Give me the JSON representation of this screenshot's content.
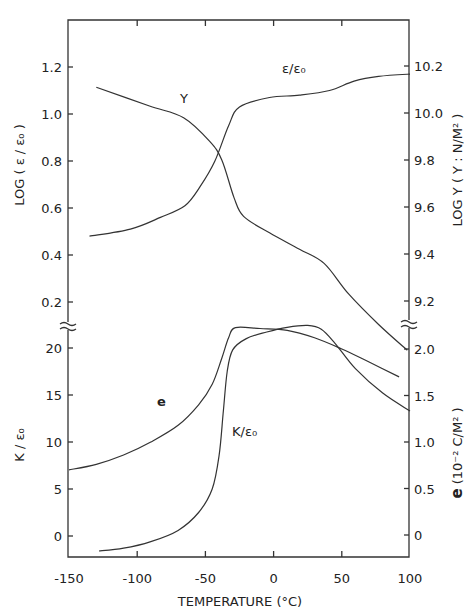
{
  "chart_data": [
    {
      "type": "line",
      "panel": "upper",
      "xlabel": "TEMPERATURE (°C)",
      "ylabel_left": "LOG (ε/ε₀)",
      "ylabel_right": "LOG Y (Y: N/M²)",
      "xlim": [
        -150,
        100
      ],
      "ylim_left": [
        0.1,
        1.4
      ],
      "ylim_right": [
        9.1,
        10.4
      ],
      "left_ticks": [
        "0.2",
        "0.4",
        "0.6",
        "0.8",
        "1.0",
        "1.2"
      ],
      "right_ticks": [
        "9.2",
        "9.4",
        "9.6",
        "9.8",
        "10.0",
        "10.2"
      ],
      "series": [
        {
          "name": "ε/ε₀",
          "axis": "left",
          "label": "ε/ε₀",
          "x": [
            -135,
            -105,
            -83,
            -65,
            -54,
            -43,
            -33,
            -25,
            -3,
            19,
            41,
            59,
            77,
            100
          ],
          "values": [
            0.48,
            0.51,
            0.56,
            0.61,
            0.69,
            0.8,
            0.95,
            1.03,
            1.07,
            1.08,
            1.1,
            1.14,
            1.16,
            1.17
          ]
        },
        {
          "name": "Y",
          "axis": "right",
          "label": "Y",
          "x": [
            -130,
            -91,
            -66,
            -47,
            -38,
            -29,
            -22,
            -3,
            19,
            37,
            55,
            77,
            98
          ],
          "values": [
            10.11,
            10.03,
            9.98,
            9.88,
            9.8,
            9.64,
            9.56,
            9.49,
            9.42,
            9.36,
            9.23,
            9.1,
            8.99
          ]
        }
      ]
    },
    {
      "type": "line",
      "panel": "lower",
      "xlabel": "TEMPERATURE (°C)",
      "ylabel_left": "K/ε₀",
      "ylabel_right": "e (10⁻² C/M²)",
      "xlim": [
        -150,
        100
      ],
      "ylim_left": [
        -2.5,
        21
      ],
      "ylim_right": [
        -0.25,
        2.1
      ],
      "left_ticks": [
        "0",
        "5",
        "10",
        "15",
        "20"
      ],
      "right_ticks": [
        "0",
        "0.5",
        "1.0",
        "1.5",
        "2.0"
      ],
      "x_ticks": [
        "-150",
        "-100",
        "-50",
        "0",
        "50",
        "100"
      ],
      "series": [
        {
          "name": "e",
          "axis": "right",
          "label": "e",
          "x": [
            -150,
            -130,
            -110,
            -90,
            -70,
            -55,
            -45,
            -38,
            -33,
            -28,
            -10,
            10,
            30,
            50,
            70,
            92
          ],
          "values": [
            0.7,
            0.76,
            0.86,
            1.0,
            1.18,
            1.4,
            1.62,
            1.9,
            2.12,
            2.23,
            2.22,
            2.2,
            2.12,
            2.0,
            1.86,
            1.7
          ]
        },
        {
          "name": "K/ε₀",
          "axis": "left",
          "label": "K/ε₀",
          "x": [
            -128,
            -110,
            -90,
            -70,
            -55,
            -45,
            -40,
            -37,
            -34,
            -30,
            -20,
            -5,
            10,
            25,
            35,
            45,
            60,
            80,
            100
          ],
          "values": [
            -1.6,
            -1.3,
            -0.6,
            0.6,
            2.5,
            5.0,
            8.5,
            13.0,
            17.5,
            19.8,
            21.0,
            21.7,
            22.2,
            22.4,
            22.0,
            20.5,
            17.8,
            15.2,
            13.3
          ]
        }
      ]
    }
  ],
  "labels": {
    "x_axis_title": "TEMPERATURE (°C)",
    "upper_left_title": "LOG ( ε / ε₀ )",
    "upper_right_title": "LOG Y ( Y : N/M² )",
    "lower_left_title": "K / ε₀",
    "lower_right_title_prefix": "e",
    "lower_right_title_rest": " (10⁻² C/M² )",
    "curve_eps": "ε/ε₀",
    "curve_Y": "Y",
    "curve_e": "e",
    "curve_K": "K/ε₀"
  }
}
